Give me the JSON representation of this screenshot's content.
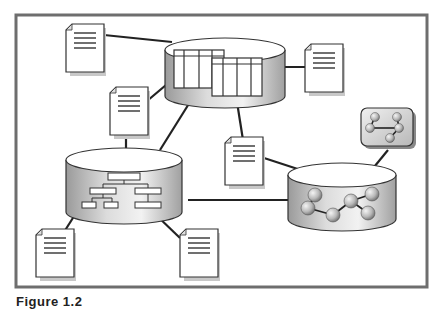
{
  "diagram": {
    "nodes": [
      {
        "id": "db-tables",
        "kind": "database",
        "content": "tables-icon"
      },
      {
        "id": "db-hierarchy",
        "kind": "database",
        "content": "org-chart-icon"
      },
      {
        "id": "db-graph",
        "kind": "database",
        "content": "molecule-graph-icon"
      },
      {
        "id": "graph-card",
        "kind": "card",
        "content": "molecule-graph-icon"
      },
      {
        "id": "doc-1",
        "kind": "document"
      },
      {
        "id": "doc-2",
        "kind": "document"
      },
      {
        "id": "doc-3",
        "kind": "document"
      },
      {
        "id": "doc-4",
        "kind": "document"
      },
      {
        "id": "doc-5",
        "kind": "document"
      },
      {
        "id": "doc-6",
        "kind": "document"
      }
    ],
    "edges": [
      [
        "doc-1",
        "db-tables"
      ],
      [
        "db-tables",
        "doc-2"
      ],
      [
        "doc-3",
        "db-tables"
      ],
      [
        "db-tables",
        "db-hierarchy"
      ],
      [
        "db-tables",
        "doc-4"
      ],
      [
        "doc-3",
        "db-hierarchy"
      ],
      [
        "doc-4",
        "db-graph"
      ],
      [
        "db-hierarchy",
        "db-graph"
      ],
      [
        "graph-card",
        "db-graph"
      ],
      [
        "db-hierarchy",
        "doc-5"
      ],
      [
        "db-hierarchy",
        "doc-6"
      ]
    ]
  },
  "caption": "Figure 1.2"
}
